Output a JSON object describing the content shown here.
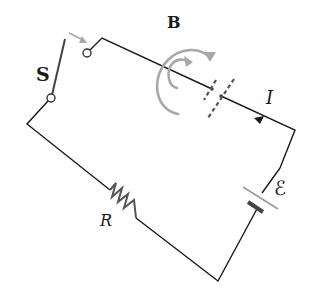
{
  "diagram": {
    "type": "circuit",
    "labels": {
      "switch": "S",
      "magnetic_field": "B",
      "current": "I",
      "emf": "ℰ",
      "resistor": "R"
    },
    "colors": {
      "wire": "#1a1a1a",
      "field_lines": "#a8a8a8",
      "arrow_gray": "#a0a0a0"
    },
    "components": [
      "switch",
      "wire",
      "resistor",
      "battery",
      "magnetic-field-loops",
      "current-arrow"
    ]
  }
}
